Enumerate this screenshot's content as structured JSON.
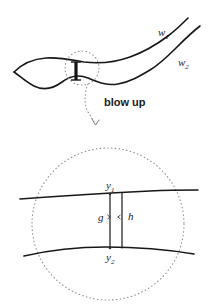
{
  "figure": {
    "background_color": "#ffffff",
    "ink_color": "#171717",
    "dotted_color": "#8c8c8c"
  },
  "upper_diagram": {
    "name": "band-region",
    "labels": {
      "w1": "w",
      "w1_sub": "1",
      "w2": "w",
      "w2_sub": "2"
    },
    "neck_bar": {
      "name": "neck-segment",
      "description": "thick vertical bar joining the two boundary curves"
    },
    "highlight_circle": {
      "name": "highlight-circle",
      "cx": 82,
      "cy": 68,
      "r": 17
    }
  },
  "connector": {
    "label": "blow up",
    "arrow": "dotted-curved-arrow"
  },
  "lower_diagram": {
    "name": "blow-up-view",
    "circle": {
      "cx": 108,
      "cy": 224,
      "r": 76
    },
    "labels": {
      "y1": "y",
      "y1_sub": "1",
      "y2": "y",
      "y2_sub": "2",
      "g": "g",
      "h": "h"
    }
  }
}
